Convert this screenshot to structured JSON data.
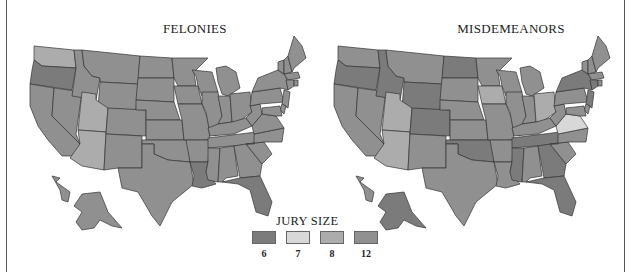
{
  "maps": [
    {
      "id": "felonies",
      "title": "FELONIES",
      "states": {
        "WA": 8,
        "OR": 6,
        "CA": 12,
        "NV": 12,
        "ID": 12,
        "MT": 12,
        "WY": 12,
        "UT": 8,
        "AZ": 8,
        "CO": 12,
        "NM": 12,
        "ND": 12,
        "SD": 12,
        "NE": 12,
        "KS": 12,
        "OK": 12,
        "TX": 12,
        "MN": 12,
        "IA": 12,
        "MO": 12,
        "AR": 12,
        "LA": 6,
        "WI": 12,
        "IL": 12,
        "MI": 12,
        "IN": 12,
        "OH": 12,
        "KY": 12,
        "TN": 12,
        "MS": 12,
        "AL": 12,
        "GA": 12,
        "FL": 6,
        "SC": 12,
        "NC": 12,
        "VA": 12,
        "WV": 12,
        "PA": 12,
        "NY": 12,
        "VT": 12,
        "NH": 12,
        "ME": 12,
        "MA": 12,
        "CT": 12,
        "RI": 12,
        "NJ": 12,
        "DE": 12,
        "MD": 12,
        "AK": 12,
        "HI": 12
      }
    },
    {
      "id": "misdemeanors",
      "title": "MISDEMEANORS",
      "states": {
        "WA": 12,
        "OR": 6,
        "CA": 12,
        "NV": 12,
        "ID": 6,
        "MT": 12,
        "WY": 6,
        "UT": 8,
        "AZ": 8,
        "CO": 6,
        "NM": 12,
        "ND": 6,
        "SD": 12,
        "NE": 12,
        "KS": 12,
        "OK": 6,
        "TX": 12,
        "MN": 12,
        "IA": 8,
        "MO": 12,
        "AR": 12,
        "LA": 12,
        "WI": 12,
        "IL": 12,
        "MI": 12,
        "IN": 12,
        "OH": 8,
        "KY": 12,
        "TN": 6,
        "MS": 6,
        "AL": 12,
        "GA": 6,
        "FL": 6,
        "SC": 12,
        "NC": 12,
        "VA": 7,
        "WV": 12,
        "PA": 12,
        "NY": 6,
        "VT": 12,
        "NH": 12,
        "ME": 12,
        "MA": 12,
        "CT": 6,
        "RI": 12,
        "NJ": 6,
        "DE": 12,
        "MD": 12,
        "AK": 6,
        "HI": 12
      }
    }
  ],
  "legend": {
    "title": "JURY SIZE",
    "items": [
      {
        "label": "6",
        "value": 6,
        "color": "#7b7b7b"
      },
      {
        "label": "7",
        "value": 7,
        "color": "#d8d8d8"
      },
      {
        "label": "8",
        "value": 8,
        "color": "#acacac"
      },
      {
        "label": "12",
        "value": 12,
        "color": "#909090"
      }
    ]
  }
}
